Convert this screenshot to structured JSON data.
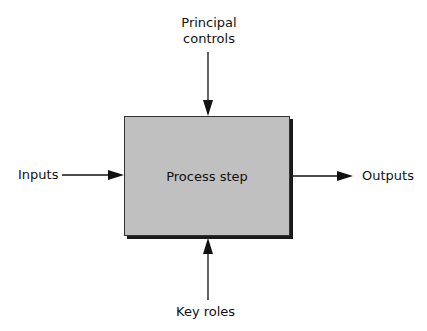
{
  "diagram": {
    "process": {
      "label": "Process step",
      "fill": "#c0c0c0"
    },
    "top": {
      "line1": "Principal",
      "line2": "controls"
    },
    "left": {
      "label": "Inputs"
    },
    "right": {
      "label": "Outputs"
    },
    "bottom": {
      "label": "Key roles"
    }
  }
}
